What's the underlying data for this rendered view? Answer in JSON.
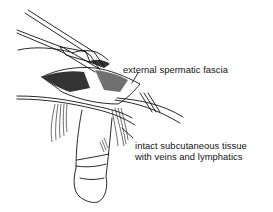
{
  "figure": {
    "ink_color": "#111111",
    "background_color": "#ffffff"
  },
  "labels": {
    "fascia": "external spermatic fascia",
    "tissue_line1": "intact subcutaneous tissue",
    "tissue_line2": "with veins and lymphatics"
  },
  "icons": {
    "forceps": "forceps-illustration",
    "retractor": "retractor-illustration",
    "leader_lines": "leader-line"
  }
}
